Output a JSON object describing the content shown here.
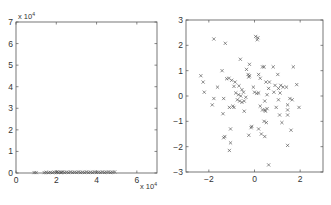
{
  "chart_data": [
    {
      "type": "scatter",
      "title": "",
      "xlabel": "",
      "ylabel": "",
      "marker": "x",
      "xlim": [
        0,
        70000
      ],
      "ylim": [
        0,
        70000
      ],
      "x_ticks": [
        0,
        2,
        4,
        6
      ],
      "y_ticks": [
        0,
        1,
        2,
        3,
        4,
        5,
        6,
        7
      ],
      "x_multiplier": "x 10^4",
      "y_multiplier": "x 10^4",
      "x_multiplier_text": "x 10",
      "y_multiplier_text": "x 10",
      "exponent": "4",
      "grid": false,
      "description": "Points lie along y≈0 with x spread between ~0.9e4 and ~4.9e4",
      "points": [
        [
          9000,
          200
        ],
        [
          10000,
          200
        ],
        [
          14000,
          200
        ],
        [
          15000,
          300
        ],
        [
          16000,
          200
        ],
        [
          17000,
          300
        ],
        [
          18000,
          200
        ],
        [
          19000,
          400
        ],
        [
          20000,
          300
        ],
        [
          20500,
          500
        ],
        [
          21000,
          300
        ],
        [
          22000,
          400
        ],
        [
          22500,
          200
        ],
        [
          23000,
          500
        ],
        [
          24000,
          300
        ],
        [
          25000,
          400
        ],
        [
          26000,
          300
        ],
        [
          27000,
          500
        ],
        [
          28000,
          300
        ],
        [
          29000,
          400
        ],
        [
          30000,
          300
        ],
        [
          31000,
          500
        ],
        [
          32000,
          300
        ],
        [
          33000,
          400
        ],
        [
          34000,
          300
        ],
        [
          35000,
          500
        ],
        [
          36000,
          300
        ],
        [
          37000,
          400
        ],
        [
          38000,
          300
        ],
        [
          39000,
          500
        ],
        [
          40000,
          300
        ],
        [
          41000,
          400
        ],
        [
          42000,
          300
        ],
        [
          43000,
          500
        ],
        [
          44000,
          300
        ],
        [
          45000,
          400
        ],
        [
          46000,
          500
        ],
        [
          47000,
          300
        ],
        [
          48000,
          400
        ],
        [
          49000,
          500
        ]
      ]
    },
    {
      "type": "scatter",
      "title": "",
      "xlabel": "",
      "ylabel": "",
      "marker": "x",
      "xlim": [
        -3,
        3
      ],
      "ylim": [
        -3,
        3
      ],
      "x_ticks": [
        -2,
        0,
        2
      ],
      "y_ticks": [
        -3,
        -2,
        -1,
        0,
        1,
        2,
        3
      ],
      "grid": false,
      "points": [
        [
          -1.78,
          2.25
        ],
        [
          -1.28,
          2.08
        ],
        [
          0.05,
          2.35
        ],
        [
          0.15,
          2.3
        ],
        [
          0.12,
          2.22
        ],
        [
          -0.62,
          1.45
        ],
        [
          0.35,
          1.15
        ],
        [
          0.42,
          1.15
        ],
        [
          0.82,
          1.15
        ],
        [
          1.7,
          1.15
        ],
        [
          -0.22,
          1.25
        ],
        [
          -1.42,
          1.0
        ],
        [
          -0.35,
          1.05
        ],
        [
          -0.28,
          0.85
        ],
        [
          -0.22,
          0.8
        ],
        [
          -0.25,
          0.75
        ],
        [
          0.18,
          0.85
        ],
        [
          0.25,
          0.7
        ],
        [
          1.02,
          0.85
        ],
        [
          -2.35,
          0.8
        ],
        [
          -2.25,
          0.55
        ],
        [
          -1.22,
          0.68
        ],
        [
          -1.12,
          0.7
        ],
        [
          -1.0,
          0.62
        ],
        [
          -0.85,
          0.55
        ],
        [
          0.5,
          0.55
        ],
        [
          0.65,
          0.55
        ],
        [
          0.9,
          0.42
        ],
        [
          1.15,
          0.42
        ],
        [
          1.25,
          0.35
        ],
        [
          1.85,
          0.45
        ],
        [
          -0.68,
          0.4
        ],
        [
          -0.9,
          0.38
        ],
        [
          -0.05,
          0.35
        ],
        [
          0.62,
          0.3
        ],
        [
          1.05,
          0.3
        ],
        [
          1.4,
          0.35
        ],
        [
          -1.62,
          0.35
        ],
        [
          -0.55,
          0.25
        ],
        [
          -2.2,
          0.15
        ],
        [
          -0.82,
          0.12
        ],
        [
          -0.48,
          0.15
        ],
        [
          0.0,
          0.15
        ],
        [
          0.1,
          0.1
        ],
        [
          0.18,
          0.12
        ],
        [
          0.55,
          0.05
        ],
        [
          0.85,
          0.15
        ],
        [
          1.12,
          0.12
        ],
        [
          -0.7,
          0.05
        ],
        [
          -0.6,
          0.0
        ],
        [
          -0.38,
          -0.05
        ],
        [
          -1.35,
          -0.1
        ],
        [
          -1.78,
          -0.1
        ],
        [
          -0.75,
          -0.15
        ],
        [
          -0.65,
          -0.2
        ],
        [
          -0.55,
          -0.25
        ],
        [
          -0.45,
          -0.2
        ],
        [
          0.45,
          -0.2
        ],
        [
          1.05,
          -0.15
        ],
        [
          1.55,
          -0.1
        ],
        [
          1.65,
          -0.15
        ],
        [
          -1.85,
          -0.35
        ],
        [
          -0.95,
          -0.4
        ],
        [
          -1.1,
          -0.45
        ],
        [
          -0.9,
          -0.45
        ],
        [
          0.25,
          -0.4
        ],
        [
          0.35,
          -0.55
        ],
        [
          0.45,
          -0.55
        ],
        [
          0.55,
          -0.5
        ],
        [
          0.48,
          -0.6
        ],
        [
          0.95,
          -0.45
        ],
        [
          1.45,
          -0.35
        ],
        [
          1.95,
          -0.45
        ],
        [
          -0.45,
          -0.6
        ],
        [
          -1.38,
          -0.7
        ],
        [
          1.45,
          -0.55
        ],
        [
          1.1,
          -0.75
        ],
        [
          1.45,
          -0.75
        ],
        [
          0.42,
          -1.0
        ],
        [
          0.52,
          -1.05
        ],
        [
          1.2,
          -1.05
        ],
        [
          -0.12,
          -1.2
        ],
        [
          -0.15,
          -1.25
        ],
        [
          -1.05,
          -1.3
        ],
        [
          0.18,
          -1.3
        ],
        [
          1.6,
          -1.35
        ],
        [
          -0.25,
          -1.55
        ],
        [
          0.3,
          -1.5
        ],
        [
          0.45,
          -1.6
        ],
        [
          -1.3,
          -1.6
        ],
        [
          -1.35,
          -1.65
        ],
        [
          -1.05,
          -1.85
        ],
        [
          1.45,
          -1.95
        ],
        [
          -1.1,
          -2.15
        ],
        [
          0.62,
          -2.72
        ]
      ]
    }
  ]
}
